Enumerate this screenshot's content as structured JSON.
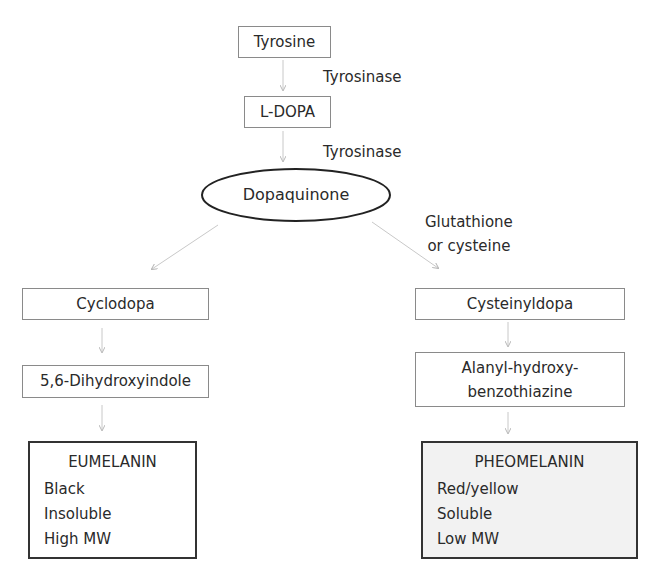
{
  "diagram": {
    "nodes": {
      "tyrosine": "Tyrosine",
      "l_dopa": "L-DOPA",
      "dopaquinone": "Dopaquinone",
      "cyclodopa": "Cyclodopa",
      "dihydroxyindole": "5,6-Dihydroxyindole",
      "cysteinyldopa": "Cysteinyldopa",
      "alanyl_line1": "Alanyl-hydroxy-",
      "alanyl_line2": "benzothiazine"
    },
    "edge_labels": {
      "tyrosinase_1": "Tyrosinase",
      "tyrosinase_2": "Tyrosinase",
      "glutathione_line1": "Glutathione",
      "glutathione_line2": "or cysteine"
    },
    "products": {
      "eumelanin": {
        "title": "EUMELANIN",
        "properties": [
          "Black",
          "Insoluble",
          "High MW"
        ]
      },
      "pheomelanin": {
        "title": "PHEOMELANIN",
        "properties": [
          "Red/yellow",
          "Soluble",
          "Low MW"
        ]
      }
    },
    "edges": [
      {
        "from": "Tyrosine",
        "to": "L-DOPA",
        "label": "Tyrosinase"
      },
      {
        "from": "L-DOPA",
        "to": "Dopaquinone",
        "label": "Tyrosinase"
      },
      {
        "from": "Dopaquinone",
        "to": "Cyclodopa",
        "label": ""
      },
      {
        "from": "Dopaquinone",
        "to": "Cysteinyldopa",
        "label": "Glutathione or cysteine"
      },
      {
        "from": "Cyclodopa",
        "to": "5,6-Dihydroxyindole",
        "label": ""
      },
      {
        "from": "5,6-Dihydroxyindole",
        "to": "EUMELANIN",
        "label": ""
      },
      {
        "from": "Cysteinyldopa",
        "to": "Alanyl-hydroxy-benzothiazine",
        "label": ""
      },
      {
        "from": "Alanyl-hydroxy-benzothiazine",
        "to": "PHEOMELANIN",
        "label": ""
      }
    ],
    "colors": {
      "node_border": "#8a8a8a",
      "product_border": "#333333",
      "pheomelanin_fill": "#f2f2f2",
      "arrow": "#c8c8c8"
    }
  }
}
